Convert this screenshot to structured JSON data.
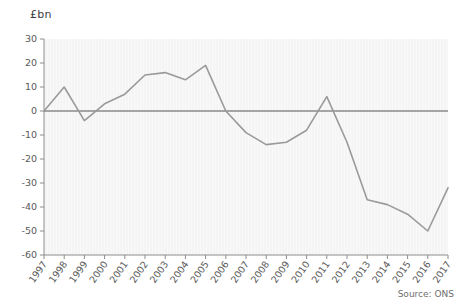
{
  "chart_data": {
    "type": "line",
    "title": "",
    "subtitle": "",
    "xlabel": "",
    "ylabel": "£bn",
    "unit_label": "£bn",
    "source": "Source: ONS",
    "grid": false,
    "legend": "none",
    "zero_line": true,
    "line_color": "#9a9a9a",
    "zero_line_color": "#555555",
    "plot_background": "#f4f4f4",
    "ylim": [
      -60,
      30
    ],
    "yticks": [
      30,
      20,
      10,
      0,
      -10,
      -20,
      -30,
      -40,
      -50,
      -60
    ],
    "ytick_labels": [
      "30",
      "20",
      "10",
      "0",
      "-10",
      "-20",
      "-30",
      "-40",
      "-50",
      "-60"
    ],
    "categories": [
      "1997",
      "1998",
      "1999",
      "2000",
      "2001",
      "2002",
      "2003",
      "2004",
      "2005",
      "2006",
      "2007",
      "2008",
      "2009",
      "2010",
      "2011",
      "2012",
      "2013",
      "2014",
      "2015",
      "2016",
      "2017"
    ],
    "x": [
      1997,
      1998,
      1999,
      2000,
      2001,
      2002,
      2003,
      2004,
      2005,
      2006,
      2007,
      2008,
      2009,
      2010,
      2011,
      2012,
      2013,
      2014,
      2015,
      2016,
      2017
    ],
    "values": [
      0,
      10,
      -4,
      3,
      7,
      15,
      16,
      13,
      19,
      0,
      -9,
      -14,
      -13,
      -8,
      6,
      -13,
      -37,
      -39,
      -43,
      -50,
      -32
    ],
    "series": [
      {
        "name": "Net balance",
        "values": [
          0,
          10,
          -4,
          3,
          7,
          15,
          16,
          13,
          19,
          0,
          -9,
          -14,
          -13,
          -8,
          6,
          -13,
          -37,
          -39,
          -43,
          -50,
          -32
        ]
      }
    ]
  }
}
